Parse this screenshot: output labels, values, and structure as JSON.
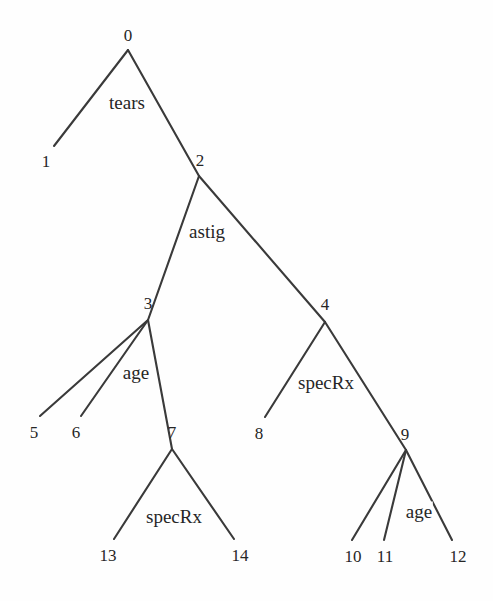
{
  "diagram": {
    "type": "decision-tree",
    "background_color": "#fefefe",
    "line_color": "#3a3a3a",
    "text_color": "#262626",
    "nodes": [
      {
        "id": "n0",
        "label": "0",
        "x": 128,
        "y": 35,
        "vx": 128,
        "vy": 50,
        "kind": "internal"
      },
      {
        "id": "n1",
        "label": "1",
        "x": 46,
        "y": 161,
        "vx": 54,
        "vy": 146,
        "kind": "leaf"
      },
      {
        "id": "n2",
        "label": "2",
        "x": 200,
        "y": 160,
        "vx": 199,
        "vy": 176,
        "kind": "internal"
      },
      {
        "id": "n3",
        "label": "3",
        "x": 148,
        "y": 303,
        "vx": 148,
        "vy": 320,
        "kind": "internal"
      },
      {
        "id": "n4",
        "label": "4",
        "x": 325,
        "y": 304,
        "vx": 325,
        "vy": 322,
        "kind": "internal"
      },
      {
        "id": "n5",
        "label": "5",
        "x": 34,
        "y": 432,
        "vx": 40,
        "vy": 416,
        "kind": "leaf"
      },
      {
        "id": "n6",
        "label": "6",
        "x": 76,
        "y": 432,
        "vx": 81,
        "vy": 416,
        "kind": "leaf"
      },
      {
        "id": "n7",
        "label": "7",
        "x": 172,
        "y": 432,
        "vx": 172,
        "vy": 449,
        "kind": "internal"
      },
      {
        "id": "n8",
        "label": "8",
        "x": 259,
        "y": 433,
        "vx": 265,
        "vy": 417,
        "kind": "leaf"
      },
      {
        "id": "n9",
        "label": "9",
        "x": 405,
        "y": 434,
        "vx": 406,
        "vy": 450,
        "kind": "internal"
      },
      {
        "id": "n10",
        "label": "10",
        "x": 353,
        "y": 556,
        "vx": 352,
        "vy": 540,
        "kind": "leaf"
      },
      {
        "id": "n11",
        "label": "11",
        "x": 385,
        "y": 556,
        "vx": 384,
        "vy": 540,
        "kind": "leaf"
      },
      {
        "id": "n12",
        "label": "12",
        "x": 458,
        "y": 556,
        "vx": 452,
        "vy": 540,
        "kind": "leaf"
      },
      {
        "id": "n13",
        "label": "13",
        "x": 108,
        "y": 555,
        "vx": 114,
        "vy": 539,
        "kind": "leaf"
      },
      {
        "id": "n14",
        "label": "14",
        "x": 240,
        "y": 555,
        "vx": 234,
        "vy": 539,
        "kind": "leaf"
      }
    ],
    "edges": [
      {
        "from": "n0",
        "to": "n1"
      },
      {
        "from": "n0",
        "to": "n2"
      },
      {
        "from": "n2",
        "to": "n3"
      },
      {
        "from": "n2",
        "to": "n4"
      },
      {
        "from": "n3",
        "to": "n5"
      },
      {
        "from": "n3",
        "to": "n6"
      },
      {
        "from": "n3",
        "to": "n7"
      },
      {
        "from": "n4",
        "to": "n8"
      },
      {
        "from": "n4",
        "to": "n9"
      },
      {
        "from": "n7",
        "to": "n13"
      },
      {
        "from": "n7",
        "to": "n14"
      },
      {
        "from": "n9",
        "to": "n10"
      },
      {
        "from": "n9",
        "to": "n11"
      },
      {
        "from": "n9",
        "to": "n12"
      }
    ],
    "edge_labels": [
      {
        "id": "lbl-tears",
        "text": "tears",
        "node": "n0",
        "x": 127,
        "y": 102
      },
      {
        "id": "lbl-astig",
        "text": "astig",
        "node": "n2",
        "x": 207,
        "y": 231
      },
      {
        "id": "lbl-age3",
        "text": "age",
        "node": "n3",
        "x": 136,
        "y": 372
      },
      {
        "id": "lbl-specrx4",
        "text": "specRx",
        "node": "n4",
        "x": 326,
        "y": 382
      },
      {
        "id": "lbl-specrx7",
        "text": "specRx",
        "node": "n7",
        "x": 174,
        "y": 516
      },
      {
        "id": "lbl-age9",
        "text": "age",
        "node": "n9",
        "x": 419,
        "y": 511
      }
    ]
  }
}
